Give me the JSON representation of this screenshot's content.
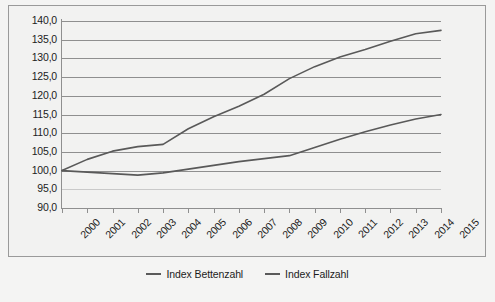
{
  "chart_data": {
    "type": "line",
    "title": "",
    "subtitle": "",
    "xlabel": "",
    "ylabel": "",
    "categories": [
      "2000",
      "2001",
      "2002",
      "2003",
      "2004",
      "2005",
      "2006",
      "2007",
      "2008",
      "2009",
      "2010",
      "2011",
      "2012",
      "2013",
      "2014",
      "2015"
    ],
    "x": [
      2000,
      2001,
      2002,
      2003,
      2004,
      2005,
      2006,
      2007,
      2008,
      2009,
      2010,
      2011,
      2012,
      2013,
      2014,
      2015
    ],
    "series": [
      {
        "name": "Index Bettenzahl",
        "color": "#595959",
        "values": [
          100.0,
          99.6,
          99.2,
          98.8,
          99.4,
          100.4,
          101.4,
          102.4,
          103.2,
          104.0,
          106.2,
          108.4,
          110.4,
          112.2,
          113.8,
          115.0
        ]
      },
      {
        "name": "Index Fallzahl",
        "color": "#595959",
        "values": [
          100.0,
          103.0,
          105.2,
          106.4,
          107.0,
          111.2,
          114.4,
          117.2,
          120.4,
          124.6,
          127.8,
          130.4,
          132.4,
          134.6,
          136.6,
          137.5
        ]
      }
    ],
    "yticks": [
      "90,0",
      "95,0",
      "100,0",
      "105,0",
      "110,0",
      "115,0",
      "120,0",
      "125,0",
      "130,0",
      "135,0",
      "140,0"
    ],
    "ytick_values": [
      90,
      95,
      100,
      105,
      110,
      115,
      120,
      125,
      130,
      135,
      140
    ],
    "ylim": [
      90,
      140
    ],
    "xlim": [
      2000,
      2015
    ],
    "grid": true,
    "legend_position": "bottom",
    "legend": [
      "Index Bettenzahl",
      "Index Fallzahl"
    ],
    "decimal_separator": ",",
    "annotations": []
  },
  "legend": {
    "items": [
      {
        "label": "Index Bettenzahl"
      },
      {
        "label": "Index Fallzahl"
      }
    ]
  },
  "colors": {
    "line": "#595959",
    "grid": "#8f8f8f",
    "grid_faint": "#c9c9c9",
    "background": "#f2f2f1",
    "border": "#9a9a9a",
    "text": "#1c1c1c"
  }
}
